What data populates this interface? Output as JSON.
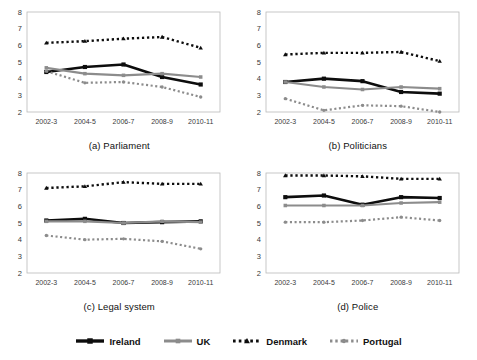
{
  "figure": {
    "panels": [
      {
        "caption": "(a) Parliament",
        "key": "parliament"
      },
      {
        "caption": "(b) Politicians",
        "key": "politicians"
      },
      {
        "caption": "(c) Legal system",
        "key": "legal_system"
      },
      {
        "caption": "(d) Police",
        "key": "police"
      }
    ]
  },
  "legend": {
    "position": "bottom-center",
    "entries": [
      {
        "label": "Ireland",
        "color": "#0d0d0d",
        "style": "solid",
        "marker": "square",
        "width": 2.6
      },
      {
        "label": "UK",
        "color": "#8c8c8c",
        "style": "solid",
        "marker": "square",
        "width": 2.2
      },
      {
        "label": "Denmark",
        "color": "#0d0d0d",
        "style": "dotted",
        "marker": "triangle",
        "width": 2.4
      },
      {
        "label": "Portugal",
        "color": "#8c8c8c",
        "style": "dotted",
        "marker": "circle",
        "width": 2.2
      }
    ]
  },
  "chart_data": [
    {
      "type": "line",
      "title": "(a) Parliament",
      "xlabel": "",
      "ylabel": "",
      "grid": false,
      "legend": "bottom",
      "categories": [
        "2002-3",
        "2004-5",
        "2006-7",
        "2008-9",
        "2010-11"
      ],
      "ylim": [
        2,
        8
      ],
      "yticks": [
        2,
        3,
        4,
        5,
        6,
        7,
        8
      ],
      "series": [
        {
          "name": "Ireland",
          "values": [
            4.4,
            4.7,
            4.85,
            4.1,
            3.65
          ]
        },
        {
          "name": "UK",
          "values": [
            4.65,
            4.3,
            4.2,
            4.3,
            4.1
          ]
        },
        {
          "name": "Denmark",
          "values": [
            6.15,
            6.25,
            6.4,
            6.5,
            5.85
          ]
        },
        {
          "name": "Portugal",
          "values": [
            4.45,
            3.75,
            3.8,
            3.5,
            2.9
          ]
        }
      ]
    },
    {
      "type": "line",
      "title": "(b) Politicians",
      "xlabel": "",
      "ylabel": "",
      "grid": false,
      "legend": "bottom",
      "categories": [
        "2002-3",
        "2004-5",
        "2006-7",
        "2008-9",
        "2010-11"
      ],
      "ylim": [
        2,
        8
      ],
      "yticks": [
        2,
        3,
        4,
        5,
        6,
        7,
        8
      ],
      "series": [
        {
          "name": "Ireland",
          "values": [
            3.8,
            4.0,
            3.85,
            3.2,
            3.1
          ]
        },
        {
          "name": "UK",
          "values": [
            3.8,
            3.5,
            3.35,
            3.5,
            3.4
          ]
        },
        {
          "name": "Denmark",
          "values": [
            5.45,
            5.55,
            5.55,
            5.6,
            5.05
          ]
        },
        {
          "name": "Portugal",
          "values": [
            2.8,
            2.1,
            2.4,
            2.35,
            2.0
          ]
        }
      ]
    },
    {
      "type": "line",
      "title": "(c) Legal system",
      "xlabel": "",
      "ylabel": "",
      "grid": false,
      "legend": "bottom",
      "categories": [
        "2002-3",
        "2004-5",
        "2006-7",
        "2008-9",
        "2010-11"
      ],
      "ylim": [
        2,
        8
      ],
      "yticks": [
        2,
        3,
        4,
        5,
        6,
        7,
        8
      ],
      "series": [
        {
          "name": "Ireland",
          "values": [
            5.15,
            5.25,
            5.0,
            5.05,
            5.1
          ]
        },
        {
          "name": "UK",
          "values": [
            5.1,
            5.1,
            5.0,
            5.1,
            5.05
          ]
        },
        {
          "name": "Denmark",
          "values": [
            7.1,
            7.2,
            7.45,
            7.35,
            7.35
          ]
        },
        {
          "name": "Portugal",
          "values": [
            4.25,
            4.0,
            4.05,
            3.9,
            3.45
          ]
        }
      ]
    },
    {
      "type": "line",
      "title": "(d) Police",
      "xlabel": "",
      "ylabel": "",
      "grid": false,
      "legend": "bottom",
      "categories": [
        "2002-3",
        "2004-5",
        "2006-7",
        "2008-9",
        "2010-11"
      ],
      "ylim": [
        2,
        8
      ],
      "yticks": [
        2,
        3,
        4,
        5,
        6,
        7,
        8
      ],
      "series": [
        {
          "name": "Ireland",
          "values": [
            6.55,
            6.65,
            6.1,
            6.55,
            6.5
          ]
        },
        {
          "name": "UK",
          "values": [
            6.05,
            6.05,
            6.05,
            6.2,
            6.25
          ]
        },
        {
          "name": "Denmark",
          "values": [
            7.85,
            7.85,
            7.8,
            7.65,
            7.65
          ]
        },
        {
          "name": "Portugal",
          "values": [
            5.05,
            5.05,
            5.15,
            5.35,
            5.15
          ]
        }
      ]
    }
  ]
}
